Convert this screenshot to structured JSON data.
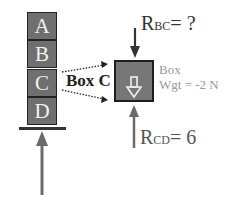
{
  "stack": {
    "blocks": [
      {
        "label": "A"
      },
      {
        "label": "B"
      },
      {
        "label": "C"
      },
      {
        "label": "D"
      }
    ]
  },
  "free_body": {
    "box_label": "Box C",
    "top_force": {
      "symbol": "R",
      "subscript": "BC",
      "value": "= ?"
    },
    "bottom_force": {
      "symbol": "R",
      "subscript": "CD",
      "value": "= 6"
    },
    "weight_line1": "Box",
    "weight_line2": "Wgt = -2 N"
  },
  "colors": {
    "block_fill": "#6f6f6f",
    "arrow": "#6a6a6a",
    "weight_text": "#999999",
    "text": "#222222"
  }
}
